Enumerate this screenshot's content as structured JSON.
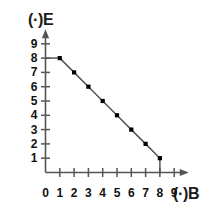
{
  "chart_data": {
    "type": "line",
    "title": "",
    "subtitle": "",
    "xlabel": "(·)B",
    "ylabel": "(·)E",
    "xlim": [
      0,
      9.6
    ],
    "ylim": [
      0,
      9.6
    ],
    "xticks": [
      0,
      1,
      2,
      3,
      4,
      5,
      6,
      7,
      8,
      9
    ],
    "yticks": [
      1,
      2,
      3,
      4,
      5,
      6,
      7,
      8,
      9
    ],
    "xtick_labels": [
      "0",
      "1",
      "2",
      "3",
      "4",
      "5",
      "6",
      "7",
      "8",
      "9"
    ],
    "ytick_labels": [
      "1",
      "2",
      "3",
      "4",
      "5",
      "6",
      "7",
      "8",
      "9"
    ],
    "origin_label": "0",
    "grid": false,
    "legend": null,
    "legend_position": "none",
    "line_color": "#555555",
    "marker_color": "#000000",
    "marker_shape": "square",
    "axis_color": "#555555",
    "series": [
      {
        "name": "budget-line",
        "x": [
          1,
          2,
          3,
          4,
          5,
          6,
          7,
          8
        ],
        "y": [
          8,
          7,
          6,
          5,
          4,
          3,
          2,
          1
        ]
      }
    ],
    "annotations": [
      {
        "name": "left-cap-segment",
        "type": "segment",
        "x1": 0,
        "y1": 8,
        "x2": 1,
        "y2": 8
      },
      {
        "name": "right-cap-segment",
        "type": "segment",
        "x1": 8,
        "y1": 1,
        "x2": 8,
        "y2": 0
      }
    ]
  }
}
